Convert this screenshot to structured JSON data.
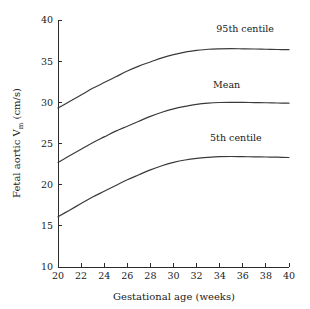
{
  "chart_data": {
    "type": "line",
    "title": "",
    "xlabel": "Gestational age (weeks)",
    "ylabel_main": "Fetal aortic V",
    "ylabel_sub": "m",
    "ylabel_unit": " (cm/s)",
    "ylabel_full": "Fetal aortic Vm (cm/s)",
    "xlim": [
      20,
      40
    ],
    "ylim": [
      10,
      40
    ],
    "xticks": [
      20,
      22,
      24,
      26,
      28,
      30,
      32,
      34,
      36,
      38,
      40
    ],
    "yticks": [
      10,
      15,
      20,
      25,
      30,
      35,
      40
    ],
    "xticklabels": [
      "20",
      "22",
      "24",
      "26",
      "28",
      "30",
      "32",
      "34",
      "36",
      "38",
      "40"
    ],
    "yticklabels": [
      "10",
      "15",
      "20",
      "25",
      "30",
      "35",
      "40"
    ],
    "grid": false,
    "legend_position": "inline-annotations",
    "x": [
      20,
      21,
      22,
      23,
      24,
      25,
      26,
      27,
      28,
      29,
      30,
      31,
      32,
      33,
      34,
      35,
      36,
      37,
      38,
      39,
      40
    ],
    "series": [
      {
        "name": "95th centile",
        "label": "95th centile",
        "color": "#3a3a3a",
        "values": [
          29.3,
          30.1,
          30.9,
          31.7,
          32.4,
          33.1,
          33.8,
          34.4,
          34.9,
          35.4,
          35.8,
          36.1,
          36.3,
          36.45,
          36.5,
          36.52,
          36.5,
          36.48,
          36.45,
          36.42,
          36.4
        ],
        "label_x": 36.2,
        "label_y": 38.5
      },
      {
        "name": "Mean",
        "label": "Mean",
        "color": "#3a3a3a",
        "values": [
          22.7,
          23.5,
          24.3,
          25.1,
          25.8,
          26.5,
          27.1,
          27.7,
          28.3,
          28.8,
          29.2,
          29.5,
          29.75,
          29.9,
          29.98,
          30.0,
          29.99,
          29.97,
          29.95,
          29.92,
          29.9
        ],
        "label_x": 34.6,
        "label_y": 31.8
      },
      {
        "name": "5th centile",
        "label": "5th centile",
        "color": "#3a3a3a",
        "values": [
          16.1,
          16.9,
          17.7,
          18.5,
          19.2,
          19.9,
          20.6,
          21.2,
          21.8,
          22.3,
          22.7,
          23.0,
          23.2,
          23.32,
          23.4,
          23.42,
          23.4,
          23.38,
          23.36,
          23.34,
          23.3
        ],
        "label_x": 35.4,
        "label_y": 25.3
      }
    ]
  }
}
